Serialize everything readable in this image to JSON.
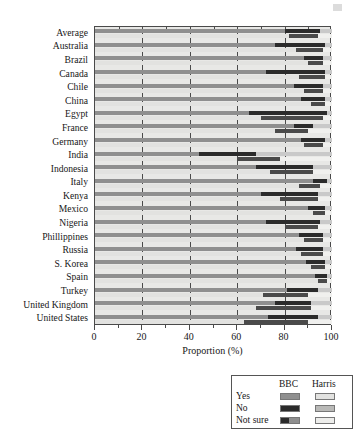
{
  "chart_data": {
    "type": "bar",
    "orientation": "horizontal",
    "stacked": true,
    "grouped": true,
    "title": "",
    "xlabel": "Proportion (%)",
    "ylabel": "",
    "xlim": [
      0,
      100
    ],
    "xticks": [
      0,
      20,
      40,
      60,
      80,
      100
    ],
    "xtick_labels": [
      "0",
      "20",
      "40",
      "60",
      "80",
      "100"
    ],
    "minor_xticks": [
      10,
      30,
      50,
      70,
      90
    ],
    "grid": true,
    "grid_axis": "x",
    "legend_position": "below-right",
    "series_groups": [
      "BBC",
      "Harris"
    ],
    "stack_order": [
      "Yes",
      "No",
      "Not sure"
    ],
    "categories": [
      "Average",
      "Australia",
      "Brazil",
      "Canada",
      "Chile",
      "China",
      "Egypt",
      "France",
      "Germany",
      "India",
      "Indonesia",
      "Italy",
      "Kenya",
      "Mexico",
      "Nigeria",
      "Phillippines",
      "Russia",
      "S. Korea",
      "Spain",
      "Turkey",
      "United Kingdom",
      "United States"
    ],
    "series": [
      {
        "name": "BBC Yes",
        "group": "BBC",
        "stack_key": "Yes",
        "color": "#8f8f8f",
        "values": [
          80,
          76,
          88,
          72,
          84,
          87,
          65,
          84,
          87,
          44,
          68,
          92,
          70,
          90,
          72,
          86,
          85,
          89,
          93,
          81,
          76,
          73
        ]
      },
      {
        "name": "BBC No",
        "group": "BBC",
        "stack_key": "No",
        "color": "#2b2b2b",
        "values": [
          15,
          21,
          8,
          25,
          12,
          10,
          33,
          8,
          10,
          24,
          24,
          6,
          24,
          7,
          23,
          10,
          11,
          8,
          5,
          13,
          15,
          21
        ]
      },
      {
        "name": "BBC Not sure",
        "group": "BBC",
        "stack_key": "Not sure",
        "color": "#c9c9c9",
        "values": [
          5,
          3,
          4,
          3,
          4,
          3,
          2,
          8,
          3,
          32,
          8,
          2,
          6,
          3,
          5,
          4,
          4,
          3,
          2,
          6,
          9,
          6
        ]
      },
      {
        "name": "Harris Yes",
        "group": "Harris",
        "stack_key": "Yes",
        "color": "#e2e2e0",
        "values": [
          82,
          85,
          90,
          86,
          88,
          91,
          70,
          76,
          88,
          60,
          74,
          86,
          78,
          92,
          80,
          88,
          87,
          91,
          94,
          71,
          68,
          63
        ]
      },
      {
        "name": "Harris No",
        "group": "Harris",
        "stack_key": "No",
        "color": "#4a4a4a",
        "values": [
          12,
          11,
          6,
          11,
          8,
          6,
          26,
          14,
          8,
          18,
          18,
          9,
          16,
          5,
          14,
          8,
          9,
          6,
          4,
          19,
          23,
          27
        ]
      },
      {
        "name": "Harris Not sure",
        "group": "Harris",
        "stack_key": "Not sure",
        "color": "#f0f0ee",
        "values": [
          6,
          4,
          4,
          3,
          4,
          3,
          4,
          10,
          4,
          22,
          8,
          5,
          6,
          3,
          6,
          4,
          4,
          3,
          2,
          10,
          9,
          10
        ]
      }
    ]
  },
  "axis": {
    "x_title": "Proportion (%)"
  },
  "legend": {
    "header_bbc": "BBC",
    "header_harris": "Harris",
    "rows": [
      {
        "label": "Yes",
        "bbc_color": "#8f8f8f",
        "harris_color": "#e2e2e0"
      },
      {
        "label": "No",
        "bbc_color": "#2b2b2b",
        "harris_color": "#b9b9b7"
      },
      {
        "label": "Not sure",
        "bbc_color": "#6e6e6e",
        "harris_color": "#ededeb"
      }
    ]
  }
}
